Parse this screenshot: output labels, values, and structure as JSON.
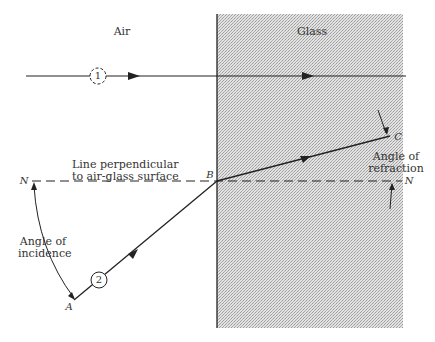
{
  "regions": {
    "left_label": "Air",
    "right_label": "Glass"
  },
  "rays": [
    {
      "id": "ray-1",
      "marker": "1"
    },
    {
      "id": "ray-2",
      "marker": "2"
    }
  ],
  "points": {
    "A": "A",
    "B": "B",
    "C": "C",
    "N_left": "N",
    "N_right": "N"
  },
  "annotations": {
    "normal_line_1": "Line perpendicular",
    "normal_line_2": "to air-glass surface",
    "incidence_1": "Angle of",
    "incidence_2": "incidence",
    "refraction_1": "Angle of",
    "refraction_2": "refraction"
  },
  "colors": {
    "ink": "#222222",
    "glass_fill": "#d4d4d4",
    "background": "#ffffff"
  }
}
